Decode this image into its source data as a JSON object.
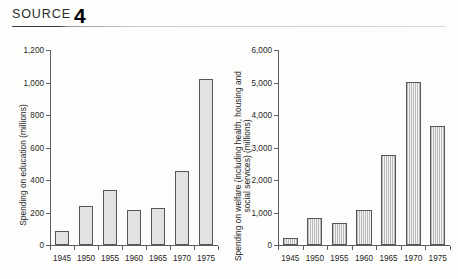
{
  "header": {
    "label": "SOURCE",
    "number": "4"
  },
  "chart_data": [
    {
      "type": "bar",
      "name": "education",
      "title": "",
      "xlabel": "",
      "ylabel": "Spending on education (millions)",
      "categories": [
        "1945",
        "1950",
        "1955",
        "1960",
        "1965",
        "1970",
        "1975"
      ],
      "values": [
        85,
        240,
        340,
        215,
        225,
        455,
        1020
      ],
      "ylim": [
        0,
        1200
      ],
      "yticks": [
        0,
        200,
        400,
        600,
        800,
        1000,
        1200
      ],
      "ytick_labels": [
        "0",
        "200",
        "400",
        "600",
        "800",
        "1,000",
        "1,200"
      ],
      "grid": false,
      "legend": "none",
      "bar_style": "solid-gray"
    },
    {
      "type": "bar",
      "name": "welfare",
      "title": "",
      "xlabel": "",
      "ylabel": "Spending on welfare (including health, housing and social services) (millions)",
      "categories": [
        "1945",
        "1950",
        "1955",
        "1960",
        "1965",
        "1970",
        "1975"
      ],
      "values": [
        220,
        830,
        670,
        1080,
        2780,
        5030,
        3650
      ],
      "ylim": [
        0,
        6000
      ],
      "yticks": [
        0,
        1000,
        2000,
        3000,
        4000,
        5000,
        6000
      ],
      "ytick_labels": [
        "0",
        "1,000",
        "2,000",
        "3,000",
        "4,000",
        "5,000",
        "6,000"
      ],
      "grid": false,
      "legend": "none",
      "bar_style": "vertical-hatch"
    }
  ]
}
